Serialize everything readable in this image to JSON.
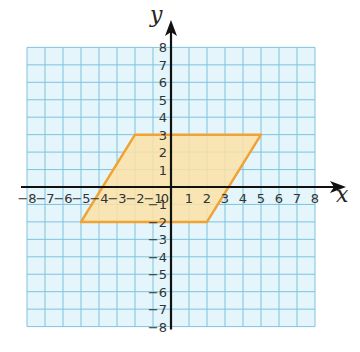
{
  "chart_data": {
    "type": "diagram",
    "title": "",
    "xlabel": "x",
    "ylabel": "y",
    "xlim": [
      -8,
      8
    ],
    "ylim": [
      -8,
      8
    ],
    "grid": true,
    "x_ticks": [
      -8,
      -7,
      -6,
      -5,
      -4,
      -3,
      -2,
      -1,
      0,
      1,
      2,
      3,
      4,
      5,
      6,
      7,
      8
    ],
    "y_ticks": [
      -8,
      -7,
      -6,
      -5,
      -4,
      -3,
      -2,
      -1,
      1,
      2,
      3,
      4,
      5,
      6,
      7,
      8
    ],
    "shapes": [
      {
        "type": "parallelogram",
        "vertices": [
          [
            -2,
            3
          ],
          [
            5,
            3
          ],
          [
            2,
            -2
          ],
          [
            -5,
            -2
          ]
        ],
        "fill": "#fde2a6",
        "stroke": "#f0a334"
      }
    ]
  },
  "colors": {
    "grid_bg": "#e4f5fb",
    "grid_line": "#7fc3de",
    "axis": "#111111"
  }
}
